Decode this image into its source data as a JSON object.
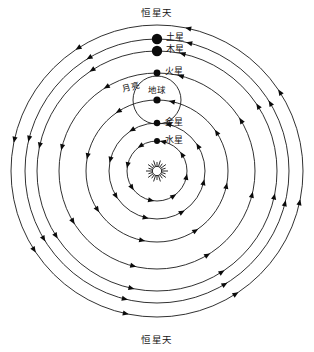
{
  "diagram": {
    "type": "astronomical-orbit-diagram",
    "center": {
      "x": 157,
      "y": 171
    },
    "background_color": "#ffffff",
    "line_color": "#1a1a1a",
    "dot_color": "#0b0b0b"
  },
  "labels": {
    "outer_sphere_top": "恒星天",
    "outer_sphere_bottom": "恒星天",
    "saturn": "土星",
    "jupiter": "木星",
    "mars": "火星",
    "moon": "月亮",
    "earth": "地球",
    "venus": "金星",
    "mercury": "水星"
  },
  "chart_data": {
    "type": "scatter",
    "xlabel": "",
    "ylabel": "",
    "center_body": {
      "name": "太阳",
      "x": 157,
      "y": 171,
      "radius": 11,
      "style": "starburst"
    },
    "orbits": [
      {
        "name": "水星轨道",
        "body": "水星",
        "radius": 30,
        "body_dot_radius": 3.0,
        "arrow_count": 8
      },
      {
        "name": "金星轨道",
        "body": "金星",
        "radius": 48,
        "body_dot_radius": 3.2,
        "arrow_count": 8
      },
      {
        "name": "地球轨道",
        "body": "地球",
        "radius": 71,
        "body_dot_radius": 3.6,
        "arrow_count": 8
      },
      {
        "name": "火星轨道",
        "body": "火星",
        "radius": 98,
        "body_dot_radius": 3.4,
        "arrow_count": 8
      },
      {
        "name": "木星轨道",
        "body": "木星",
        "radius": 120,
        "body_dot_radius": 5.2,
        "arrow_count": 8
      },
      {
        "name": "土星轨道",
        "body": "土星",
        "radius": 132,
        "body_dot_radius": 5.2,
        "arrow_count": 8
      },
      {
        "name": "恒星天",
        "body": "",
        "radius": 146,
        "body_dot_radius": 0,
        "arrow_count": 8
      }
    ],
    "moon_orbit": {
      "center_on": "地球",
      "radius": 24
    },
    "bodies": [
      {
        "name": "水星",
        "label": "水星",
        "angle_deg": 90,
        "orbit_radius": 30,
        "dot_radius": 3.0,
        "label_dx": 8,
        "label_dy": -1
      },
      {
        "name": "金星",
        "label": "金星",
        "angle_deg": 90,
        "orbit_radius": 48,
        "dot_radius": 3.2,
        "label_dx": 8,
        "label_dy": -1
      },
      {
        "name": "地球",
        "label": "地球",
        "angle_deg": 90,
        "orbit_radius": 71,
        "dot_radius": 3.6,
        "label_dx": 0,
        "label_dy": -10
      },
      {
        "name": "火星",
        "label": "火星",
        "angle_deg": 90,
        "orbit_radius": 98,
        "dot_radius": 3.4,
        "label_dx": 8,
        "label_dy": -2
      },
      {
        "name": "木星",
        "label": "木星",
        "angle_deg": 90,
        "orbit_radius": 120,
        "dot_radius": 5.2,
        "label_dx": 9,
        "label_dy": -2
      },
      {
        "name": "土星",
        "label": "土星",
        "angle_deg": 90,
        "orbit_radius": 132,
        "dot_radius": 5.2,
        "label_dx": 9,
        "label_dy": -2
      }
    ],
    "annotations": [
      {
        "text": "恒星天",
        "x": 157,
        "y": 13,
        "anchor": "middle"
      },
      {
        "text": "恒星天",
        "x": 157,
        "y": 340,
        "anchor": "middle"
      },
      {
        "text": "月亮",
        "x": 122,
        "y": 90,
        "anchor": "start"
      }
    ],
    "orbit_direction": "counterclockwise",
    "grid": false,
    "legend": null
  }
}
